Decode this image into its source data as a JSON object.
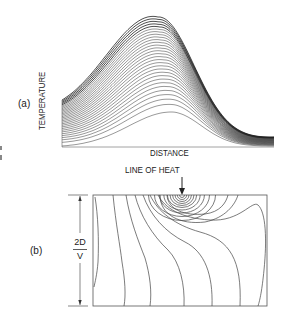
{
  "figure": {
    "panel_a": {
      "label": "(a)",
      "ylabel": "TEMPERATURE",
      "xlabel": "DISTANCE",
      "curve_count": 30,
      "description": "Family of temperature-vs-distance curves rising to a peak that shifts slightly left as amplitude grows"
    },
    "panel_b": {
      "label": "(b)",
      "source_label": "LINE OF HEAT",
      "arrow_icon": "down-arrow",
      "dimension_numerator": "2D",
      "dimension_denominator": "V",
      "description": "Isotherm contours around a moving line heat source in a rectangular section"
    },
    "colors": {
      "line": "#333333",
      "background": "#ffffff",
      "text": "#222222"
    }
  }
}
